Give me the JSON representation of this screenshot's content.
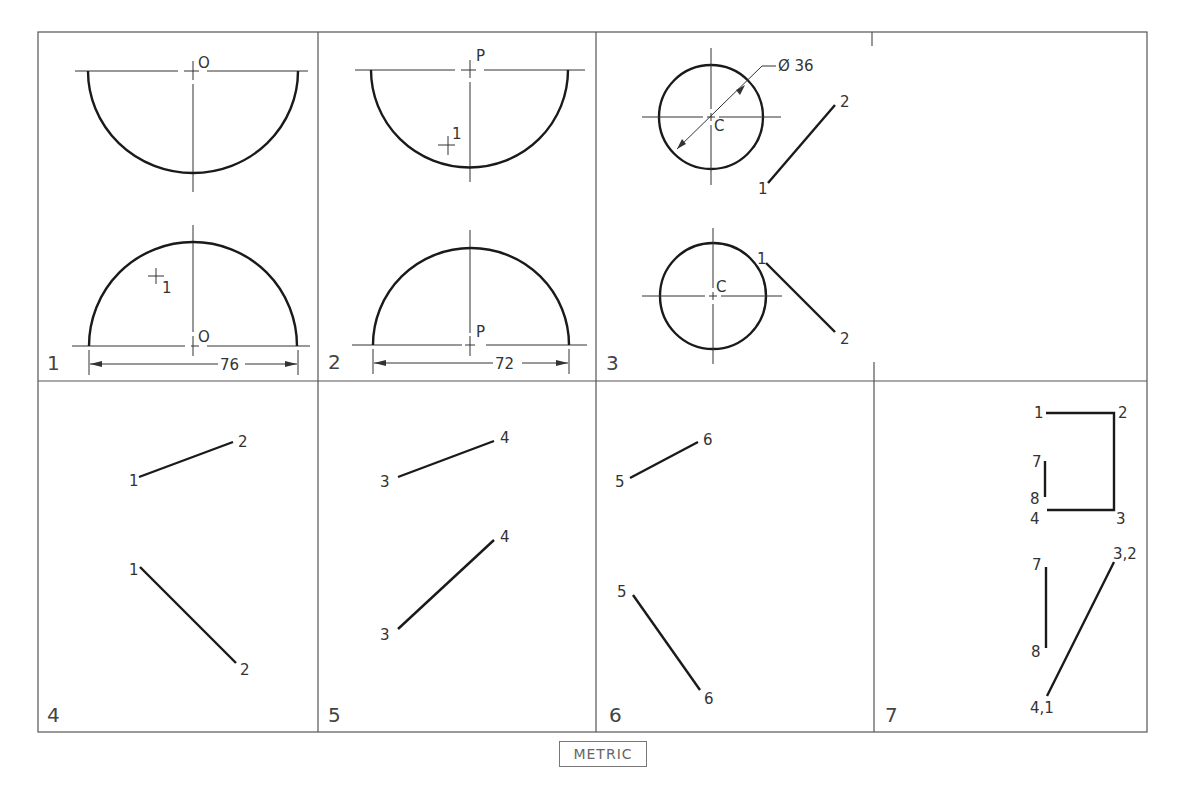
{
  "figure": {
    "panels": [
      {
        "number": "1",
        "top_label": "O",
        "bottom_label": "O",
        "point_label": "1",
        "dimension": "76"
      },
      {
        "number": "2",
        "top_label": "P",
        "bottom_label": "P",
        "point_label": "1",
        "dimension": "72"
      },
      {
        "number": "3",
        "center_label_top": "C",
        "center_label_bottom": "C",
        "diameter": "Ø 36",
        "line_top": [
          "1",
          "2"
        ],
        "line_bottom": [
          "1",
          "2"
        ]
      },
      {
        "number": "4",
        "line_top": [
          "1",
          "2"
        ],
        "line_bottom": [
          "1",
          "2"
        ]
      },
      {
        "number": "5",
        "line_top": [
          "3",
          "4"
        ],
        "line_bottom": [
          "3",
          "4"
        ]
      },
      {
        "number": "6",
        "line_top": [
          "5",
          "6"
        ],
        "line_bottom": [
          "5",
          "6"
        ]
      },
      {
        "number": "7",
        "top_labels": [
          "1",
          "2",
          "3",
          "4",
          "7",
          "8"
        ],
        "bottom_labels": [
          "7",
          "8",
          "3,2",
          "4,1"
        ]
      }
    ],
    "units_badge": "METRIC"
  }
}
